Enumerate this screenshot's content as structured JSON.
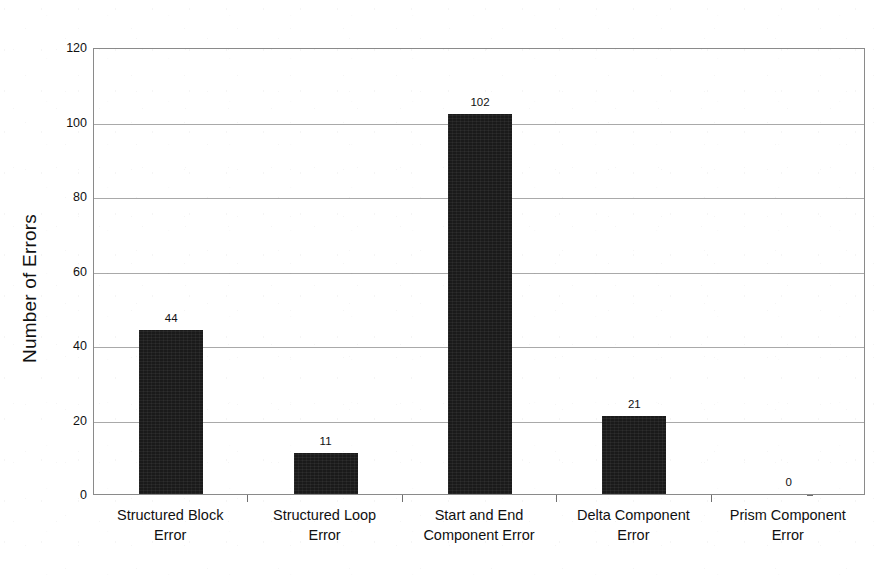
{
  "chart_data": {
    "type": "bar",
    "title": "",
    "subtitle": "",
    "xlabel": "",
    "ylabel": "Number of Errors",
    "ylim": [
      0,
      120
    ],
    "ytick_step": 20,
    "yticks": [
      0,
      20,
      40,
      60,
      80,
      100,
      120
    ],
    "ytick_labels": [
      "0",
      "20",
      "40",
      "60",
      "80",
      "100",
      "120"
    ],
    "categories": [
      "Structured Block Error",
      "Structured Loop Error",
      "Start and End Component Error",
      "Delta Component Error",
      "Prism Component Error"
    ],
    "category_lines": [
      [
        "Structured Block",
        "Error"
      ],
      [
        "Structured Loop",
        "Error"
      ],
      [
        "Start and End",
        "Component Error"
      ],
      [
        "Delta Component",
        "Error"
      ],
      [
        "Prism Component",
        "Error"
      ]
    ],
    "values": [
      44,
      11,
      102,
      21,
      0
    ],
    "value_labels": [
      "44",
      "11",
      "102",
      "21",
      "0"
    ],
    "grid": true,
    "grid_axis": "y",
    "legend": false,
    "legend_position": "none",
    "bar_color": "#1a1a1a",
    "grid_color": "#a9a9a9",
    "axis_color": "#8a8a8a",
    "background_color": "#ffffff",
    "text_color": "#111111"
  }
}
